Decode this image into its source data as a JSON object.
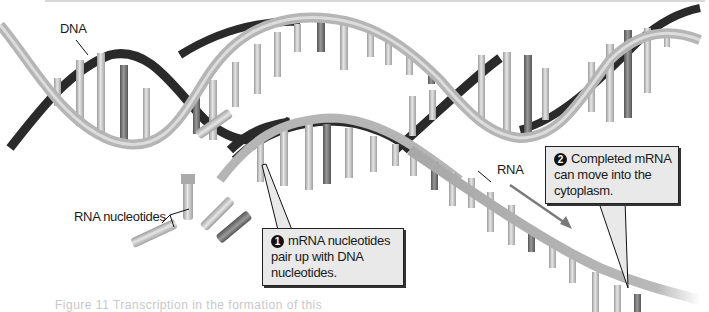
{
  "figure": {
    "labels": {
      "dna": "DNA",
      "rna": "RNA",
      "rna_nucleotides": "RNA nucleotides"
    },
    "callouts": [
      {
        "number": "1",
        "lines": [
          "mRNA nucleotides",
          "pair up with DNA",
          "nucleotides."
        ]
      },
      {
        "number": "2",
        "lines": [
          "Completed mRNA",
          "can move into the",
          "cytoplasm."
        ]
      }
    ],
    "caption": "Figure 11 Transcription in the formation of this",
    "colors": {
      "backbone_light": "#b5b5b5",
      "backbone_dark": "#2a2a2a",
      "callout_fill": "#e9e9e9",
      "rung": "#c9c9c9",
      "arrow": "#7a7a7a"
    },
    "free_nucleotides": [
      "U",
      "A",
      "U",
      "C"
    ],
    "rna_bases": [
      "U",
      "A",
      "U",
      "A",
      "G",
      "C",
      "U",
      "U",
      "A"
    ]
  }
}
